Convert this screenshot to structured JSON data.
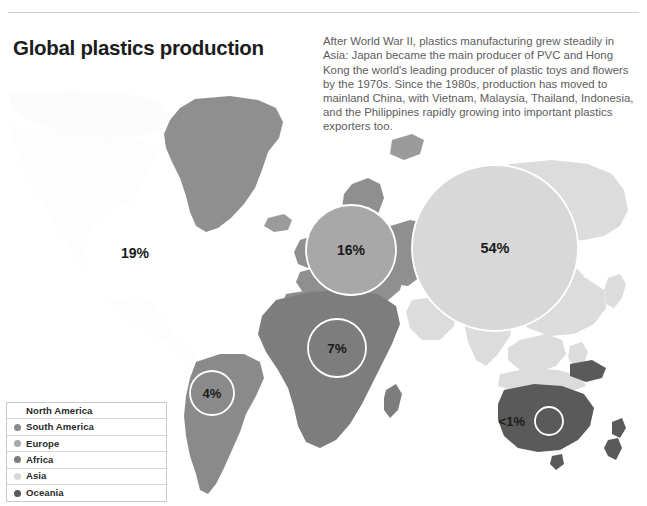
{
  "page": {
    "title": "Global plastics production",
    "description": "After World War II, plastics manufacturing grew steadily in Asia: Japan became the main producer of PVC and Hong Kong the world's leading producer of plastic toys and flowers by the 1970s. Since the 1980s, production has moved to mainland China, with Vietnam, Malaysia, Thailand, Indonesia, and the Philippines rapidly growing into important plastics exporters too."
  },
  "legend": {
    "items": [
      {
        "label": "North America",
        "color": "#ffffff",
        "has_swatch": false
      },
      {
        "label": "South America",
        "color": "#8a8a8a",
        "has_swatch": true
      },
      {
        "label": "Europe",
        "color": "#a8a8a8",
        "has_swatch": true
      },
      {
        "label": "Africa",
        "color": "#7d7d7d",
        "has_swatch": true
      },
      {
        "label": "Asia",
        "color": "#d8d8d8",
        "has_swatch": true
      },
      {
        "label": "Oceania",
        "color": "#5a5a5a",
        "has_swatch": true
      }
    ]
  },
  "chart_data": {
    "type": "bubble-map",
    "title": "Global plastics production",
    "unit": "percent of global plastics production",
    "legend_position": "bottom-left",
    "bubble_ring_color": "#ffffff",
    "ocean_color": "#ffffff",
    "categories": [
      "North America",
      "South America",
      "Europe",
      "Africa",
      "Asia",
      "Oceania"
    ],
    "values": [
      19,
      4,
      16,
      7,
      54,
      0.5
    ],
    "labels": [
      "19%",
      "4%",
      "16%",
      "7%",
      "54%",
      "<1%"
    ],
    "regions": [
      {
        "name": "North America",
        "label": "19%",
        "value": 19,
        "fill": "#ffffff",
        "cx": 135,
        "cy": 175,
        "r": 49,
        "label_inside": true
      },
      {
        "name": "South America",
        "label": "4%",
        "value": 4,
        "fill": "#8a8a8a",
        "cx": 212,
        "cy": 315,
        "r": 22,
        "label_inside": true
      },
      {
        "name": "Europe",
        "label": "16%",
        "value": 16,
        "fill": "#a8a8a8",
        "cx": 351,
        "cy": 172,
        "r": 45,
        "label_inside": true
      },
      {
        "name": "Africa",
        "label": "7%",
        "value": 7,
        "fill": "#7d7d7d",
        "cx": 337,
        "cy": 270,
        "r": 29,
        "label_inside": true
      },
      {
        "name": "Asia",
        "label": "54%",
        "value": 54,
        "fill": "#d8d8d8",
        "cx": 495,
        "cy": 170,
        "r": 83,
        "label_inside": true
      },
      {
        "name": "Oceania",
        "label": "<1%",
        "value": 0.5,
        "fill": "#5a5a5a",
        "cx": 549,
        "cy": 343,
        "r": 14,
        "label_inside": false
      }
    ],
    "landmass_colors": {
      "north_america": "#fdfdfd",
      "south_america": "#8a8a8a",
      "europe": "#a8a8a8",
      "africa": "#7d7d7d",
      "asia": "#d8d8d8",
      "oceania": "#5a5a5a"
    }
  }
}
